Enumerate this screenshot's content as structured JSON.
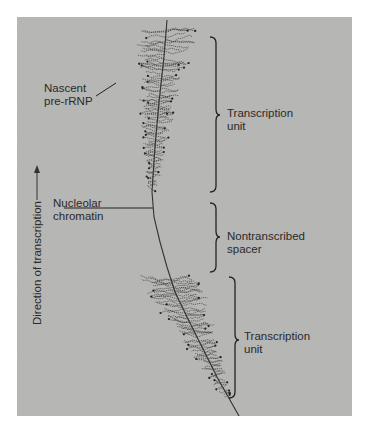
{
  "figure": {
    "type": "electron micrograph with annotations",
    "labels": {
      "nascent": [
        "Nascent",
        "pre-rRNP"
      ],
      "chromatin": [
        "Nucleolar",
        "chromatin"
      ],
      "direction": "Direction of transcription",
      "brace_1": [
        "Transcription",
        "unit"
      ],
      "brace_2": [
        "Nontranscribed",
        "spacer"
      ],
      "brace_3": [
        "Transcription",
        "unit"
      ]
    },
    "direction_arrow": "up",
    "colors": {
      "background": "#ffffff",
      "micrograph": "#b3b3b1",
      "fibril": "#3a3a3a",
      "text": "#2a2a2a"
    }
  }
}
